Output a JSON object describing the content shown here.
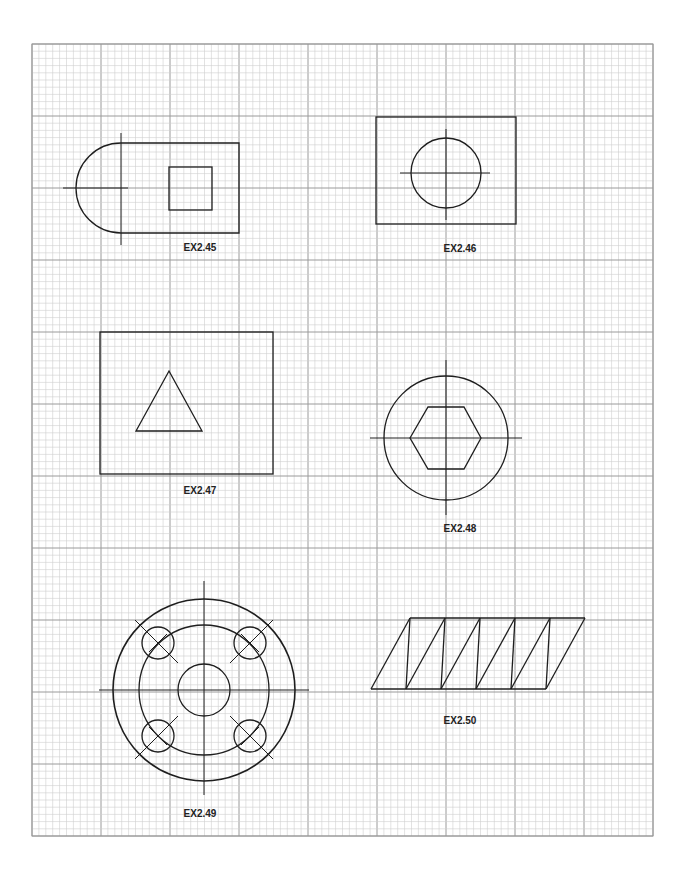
{
  "sheet": {
    "grid": {
      "left": 32,
      "top": 44,
      "right": 653,
      "bottom": 836,
      "major_x": 69,
      "major_y": 72,
      "minor_divisions": 10,
      "minor_color": "#cfcfcf",
      "major_color": "#9a9a9a",
      "border_color": "#9a9a9a"
    },
    "line_color": "#1e1e1e"
  },
  "exercises": [
    {
      "id": "ex245",
      "label": "EX2.45",
      "label_pos": [
        200,
        251
      ]
    },
    {
      "id": "ex246",
      "label": "EX2.46",
      "label_pos": [
        460,
        252
      ]
    },
    {
      "id": "ex247",
      "label": "EX2.47",
      "label_pos": [
        200,
        494
      ]
    },
    {
      "id": "ex248",
      "label": "EX2.48",
      "label_pos": [
        460,
        532
      ]
    },
    {
      "id": "ex249",
      "label": "EX2.49",
      "label_pos": [
        200,
        817
      ]
    },
    {
      "id": "ex250",
      "label": "EX2.50",
      "label_pos": [
        460,
        724
      ]
    }
  ]
}
